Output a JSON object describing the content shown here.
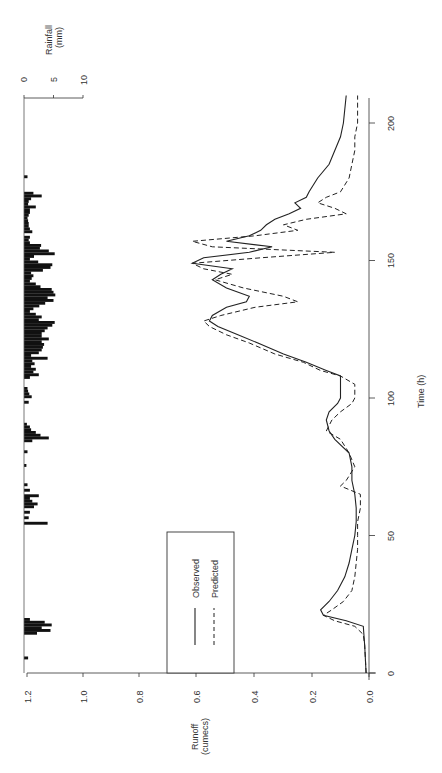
{
  "chart_data": {
    "type": "line",
    "orientation": "rotated-90-clockwise",
    "title": "",
    "xlabel": "Time (h)",
    "ylabel": "Runoff (cumecs)",
    "ylabel_lines": [
      "Runoff",
      "(cumecs)"
    ],
    "secondary_ylabel": "Rainfall (mm)",
    "secondary_ylabel_lines": [
      "Rainfall",
      "(mm)"
    ],
    "xlim": [
      0,
      210
    ],
    "ylim": [
      0.0,
      1.2
    ],
    "secondary_ylim": [
      0,
      10
    ],
    "x_ticks": [
      "0",
      "50",
      "100",
      "150",
      "200"
    ],
    "y_ticks": [
      "0.0",
      "0.2",
      "0.4",
      "0.6",
      "0.8",
      "1.0",
      "1.2"
    ],
    "secondary_ticks": [
      "0",
      "5",
      "10"
    ],
    "grid": false,
    "legend": {
      "position": "inside-lower-left",
      "entries": [
        "Observed",
        "Predicted"
      ]
    },
    "series": [
      {
        "name": "Observed",
        "style": "solid",
        "x": [
          0,
          10,
          17,
          19,
          21,
          23,
          26,
          30,
          35,
          40,
          45,
          50,
          55,
          60,
          65,
          70,
          75,
          80,
          85,
          88,
          92,
          95,
          98,
          100,
          105,
          108,
          110,
          113,
          116,
          120,
          123,
          126,
          128,
          130,
          133,
          135,
          137,
          140,
          143,
          145,
          147,
          149,
          151,
          153,
          155,
          157,
          159,
          161,
          163,
          165,
          167,
          169,
          171,
          173,
          175,
          180,
          185,
          190,
          195,
          200,
          210
        ],
        "y": [
          0.01,
          0.015,
          0.02,
          0.08,
          0.16,
          0.17,
          0.14,
          0.11,
          0.085,
          0.07,
          0.06,
          0.05,
          0.045,
          0.045,
          0.05,
          0.06,
          0.06,
          0.07,
          0.12,
          0.14,
          0.15,
          0.14,
          0.11,
          0.1,
          0.1,
          0.1,
          0.15,
          0.22,
          0.3,
          0.39,
          0.46,
          0.53,
          0.56,
          0.55,
          0.5,
          0.43,
          0.42,
          0.5,
          0.55,
          0.52,
          0.48,
          0.62,
          0.58,
          0.42,
          0.34,
          0.5,
          0.42,
          0.38,
          0.36,
          0.33,
          0.28,
          0.24,
          0.26,
          0.22,
          0.21,
          0.18,
          0.14,
          0.12,
          0.1,
          0.09,
          0.08
        ]
      },
      {
        "name": "Predicted",
        "style": "dashed",
        "x": [
          0,
          10,
          14,
          17,
          19,
          21,
          23,
          26,
          30,
          35,
          40,
          45,
          50,
          55,
          60,
          65,
          68,
          70,
          75,
          80,
          85,
          88,
          92,
          95,
          98,
          100,
          105,
          108,
          110,
          113,
          116,
          120,
          123,
          126,
          128,
          130,
          133,
          135,
          137,
          140,
          143,
          145,
          147,
          149,
          151,
          153,
          155,
          157,
          159,
          161,
          163,
          165,
          167,
          169,
          171,
          173,
          175,
          180,
          185,
          190,
          195,
          200,
          210
        ],
        "y": [
          0.01,
          0.015,
          0.02,
          0.05,
          0.12,
          0.16,
          0.13,
          0.09,
          0.06,
          0.05,
          0.045,
          0.04,
          0.04,
          0.04,
          0.03,
          0.03,
          0.1,
          0.08,
          0.05,
          0.07,
          0.1,
          0.15,
          0.13,
          0.1,
          0.06,
          0.05,
          0.05,
          0.1,
          0.17,
          0.23,
          0.33,
          0.42,
          0.5,
          0.56,
          0.58,
          0.52,
          0.4,
          0.25,
          0.3,
          0.44,
          0.54,
          0.48,
          0.58,
          0.62,
          0.38,
          0.12,
          0.55,
          0.62,
          0.4,
          0.25,
          0.3,
          0.22,
          0.08,
          0.12,
          0.18,
          0.15,
          0.1,
          0.07,
          0.06,
          0.05,
          0.05,
          0.04,
          0.04
        ]
      },
      {
        "name": "Rainfall",
        "type": "bar",
        "axis": "secondary",
        "x": [
          5,
          14,
          15,
          16,
          17,
          18,
          19,
          54,
          56,
          58,
          60,
          61,
          62,
          63,
          64,
          66,
          68,
          75,
          80,
          84,
          85,
          86,
          87,
          88,
          89,
          90,
          98,
          100,
          101,
          102,
          103,
          107,
          108,
          109,
          110,
          111,
          112,
          113,
          114,
          115,
          116,
          117,
          118,
          119,
          120,
          121,
          122,
          123,
          124,
          125,
          126,
          127,
          128,
          129,
          130,
          131,
          132,
          133,
          134,
          135,
          136,
          137,
          138,
          139,
          140,
          141,
          142,
          143,
          144,
          145,
          146,
          147,
          148,
          149,
          150,
          151,
          152,
          153,
          154,
          155,
          156,
          157,
          158,
          160,
          161,
          162,
          163,
          164,
          165,
          166,
          167,
          168,
          169,
          170,
          171,
          172,
          173,
          174,
          180
        ],
        "values": [
          0.7,
          2.2,
          4.5,
          3.0,
          4.7,
          3.5,
          1.0,
          4.0,
          0.8,
          1.0,
          1.7,
          2.3,
          1.4,
          1.0,
          2.5,
          1.0,
          0.6,
          0.4,
          0.6,
          1.4,
          4.2,
          2.8,
          2.0,
          1.2,
          1.0,
          0.5,
          0.8,
          1.3,
          0.9,
          0.7,
          0.6,
          1.0,
          2.5,
          1.6,
          2.0,
          1.2,
          1.8,
          1.4,
          4.0,
          1.2,
          2.5,
          3.0,
          3.2,
          3.4,
          3.0,
          4.2,
          3.0,
          3.0,
          3.5,
          4.0,
          4.8,
          5.2,
          2.5,
          3.0,
          2.0,
          1.0,
          1.6,
          2.6,
          3.6,
          5.0,
          4.0,
          5.3,
          5.0,
          4.7,
          2.8,
          2.0,
          1.0,
          1.3,
          1.6,
          1.2,
          3.2,
          4.5,
          4.8,
          2.4,
          1.0,
          1.7,
          5.2,
          4.2,
          2.7,
          2.9,
          1.0,
          0.8,
          1.0,
          1.4,
          1.0,
          0.8,
          0.8,
          0.7,
          0.6,
          0.8,
          1.0,
          1.0,
          2.0,
          0.7,
          0.8,
          1.2,
          3.0,
          1.6,
          0.6
        ]
      }
    ]
  },
  "axes": {
    "runoff_ticks": [
      "0.0",
      "0.2",
      "0.4",
      "0.6",
      "0.8",
      "1.0",
      "1.2"
    ],
    "time_ticks": [
      "0",
      "50",
      "100",
      "150",
      "200"
    ],
    "rain_ticks": [
      "0",
      "5",
      "10"
    ],
    "runoff_label_1": "Runoff",
    "runoff_label_2": "(cumecs)",
    "rain_label_1": "Rainfall",
    "rain_label_2": "(mm)",
    "time_label": "Time (h)"
  },
  "legend": {
    "observed": "Observed",
    "predicted": "Predicted"
  }
}
